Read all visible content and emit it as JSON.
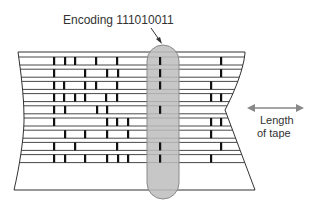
{
  "figure": {
    "callout_label": "Encoding 111010011",
    "encoded_bits": "111010011",
    "length_label_line1": "Length",
    "length_label_line2": "of tape",
    "colors": {
      "line": "#333333",
      "mark": "#111111",
      "highlight_fill": "#bdbdbd",
      "highlight_stroke": "#8a8a8a",
      "arrow": "#888888",
      "text": "#333333"
    }
  },
  "tape": {
    "track_count": 9,
    "column_x": [
      54,
      65,
      75,
      86,
      97,
      107,
      118,
      128,
      160,
      211,
      221
    ],
    "tracks": [
      {
        "marks_x": [
          54,
          65,
          75,
          96,
          117,
          160,
          221
        ]
      },
      {
        "marks_x": [
          54,
          85,
          107,
          118,
          160,
          221
        ]
      },
      {
        "marks_x": [
          54,
          64,
          85,
          96,
          117,
          160,
          211
        ]
      },
      {
        "marks_x": [
          54,
          64,
          75,
          85,
          106,
          117,
          211,
          221
        ]
      },
      {
        "marks_x": [
          54,
          65,
          97,
          107,
          160
        ]
      },
      {
        "marks_x": [
          54,
          107,
          117,
          128,
          211,
          221
        ]
      },
      {
        "marks_x": [
          65,
          85,
          107,
          128,
          211
        ]
      },
      {
        "marks_x": [
          54,
          75,
          117,
          160,
          221
        ]
      },
      {
        "marks_x": [
          54,
          65,
          85,
          107,
          118,
          128,
          160,
          211
        ]
      }
    ]
  }
}
